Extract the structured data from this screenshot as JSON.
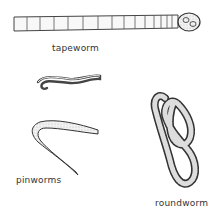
{
  "figure": {
    "labels": {
      "tapeworm": "tapeworm",
      "pinworms": "pinworms",
      "roundworm": "roundworm"
    },
    "colors": {
      "ink": "#333333",
      "fill": "#f4f4f4",
      "background": "#ffffff"
    }
  }
}
